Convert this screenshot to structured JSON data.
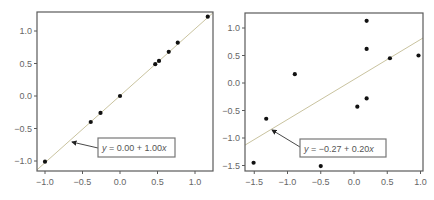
{
  "colors": {
    "frame": "#5a5a5a",
    "fit_line": "#c9c39f",
    "point": "#111111",
    "tick_text": "#666666",
    "annotation_border": "#777777"
  },
  "chart_data": [
    {
      "type": "scatter",
      "title": "",
      "xlabel": "",
      "ylabel": "",
      "xlim": [
        -1.13,
        1.25
      ],
      "ylim": [
        -1.16,
        1.29
      ],
      "grid": false,
      "xticks": [
        -1.0,
        -0.5,
        0.0,
        0.5,
        1.0
      ],
      "xtick_labels": [
        "−1.0",
        "−0.5",
        "0.0",
        "0.5",
        "1.0"
      ],
      "yticks": [
        -1.0,
        -0.5,
        0.0,
        0.5,
        1.0
      ],
      "ytick_labels": [
        "−1.0",
        "−0.5",
        "0.0",
        "0.5",
        "1.0"
      ],
      "points": [
        {
          "x": -1.0,
          "y": -1.01
        },
        {
          "x": -0.39,
          "y": -0.4
        },
        {
          "x": -0.26,
          "y": -0.26
        },
        {
          "x": 0.0,
          "y": 0.0
        },
        {
          "x": 0.47,
          "y": 0.49
        },
        {
          "x": 0.52,
          "y": 0.54
        },
        {
          "x": 0.65,
          "y": 0.68
        },
        {
          "x": 0.77,
          "y": 0.82
        },
        {
          "x": 1.17,
          "y": 1.22
        }
      ],
      "fit_line": {
        "x0": -1.13,
        "y0": -1.16,
        "x1": 1.25,
        "y1": 1.29
      },
      "annotation": {
        "prefix": "y",
        "text": " = 0.00 + 1.00",
        "suffix": "x",
        "box": {
          "x": 98,
          "y": 138,
          "w": 77,
          "h": 19
        },
        "arrow_from": {
          "x": 98,
          "y": 148
        },
        "arrow_to": {
          "x": 72,
          "y": 142
        }
      },
      "frame_px": {
        "left": 37,
        "top": 12,
        "right": 213,
        "bottom": 171
      },
      "scale_px": {
        "x0": 120,
        "xk": 75,
        "y0": 96,
        "yk": 65
      }
    },
    {
      "type": "scatter",
      "title": "",
      "xlabel": "",
      "ylabel": "",
      "xlim": [
        -1.64,
        1.04
      ],
      "ylim": [
        -1.6,
        1.27
      ],
      "grid": false,
      "xticks": [
        -1.5,
        -1.0,
        -0.5,
        0.0,
        0.5,
        1.0
      ],
      "xtick_labels": [
        "−1.5",
        "−1.0",
        "−0.5",
        "0.0",
        "0.5",
        "1.0"
      ],
      "yticks": [
        -1.5,
        -1.0,
        -0.5,
        0.0,
        0.5,
        1.0
      ],
      "ytick_labels": [
        "−1.5",
        "−1.0",
        "−0.5",
        "0.0",
        "0.5",
        "1.0"
      ],
      "points": [
        {
          "x": -1.51,
          "y": -1.45
        },
        {
          "x": -1.32,
          "y": -0.65
        },
        {
          "x": -0.89,
          "y": 0.16
        },
        {
          "x": -0.5,
          "y": -1.51
        },
        {
          "x": 0.05,
          "y": -0.43
        },
        {
          "x": 0.19,
          "y": -0.28
        },
        {
          "x": 0.19,
          "y": 1.13
        },
        {
          "x": 0.19,
          "y": 0.62
        },
        {
          "x": 0.54,
          "y": 0.45
        },
        {
          "x": 0.97,
          "y": 0.5
        }
      ],
      "fit_line": {
        "x0": -1.64,
        "y0": -1.13,
        "x1": 1.04,
        "y1": 0.82
      },
      "annotation": {
        "prefix": "y",
        "text": " = −0.27 + 0.20",
        "suffix": "x",
        "box": {
          "x": 300,
          "y": 139,
          "w": 86,
          "h": 18
        },
        "arrow_from": {
          "x": 300,
          "y": 147
        },
        "arrow_to": {
          "x": 272,
          "y": 130
        }
      },
      "frame_px": {
        "left": 245,
        "top": 13,
        "right": 423,
        "bottom": 171
      },
      "scale_px": {
        "x0": 354,
        "xk": 66.5,
        "y0": 83,
        "yk": 55
      }
    }
  ]
}
